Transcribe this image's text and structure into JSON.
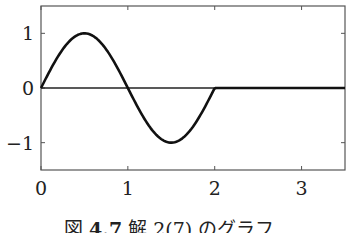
{
  "chart_data": {
    "type": "line",
    "title": "",
    "xlabel": "",
    "ylabel": "",
    "xlim": [
      0,
      3.5
    ],
    "ylim": [
      -1.5,
      1.5
    ],
    "grid": false,
    "legend": null,
    "x_ticks": [
      0,
      1,
      2,
      3
    ],
    "y_ticks": [
      -1,
      0,
      1
    ],
    "x_tick_labels": [
      "0",
      "1",
      "2",
      "3"
    ],
    "y_tick_labels": [
      "−1",
      "0",
      "1"
    ],
    "horizontal_reference_line": 0,
    "series": [
      {
        "name": "y = sin(πx) for 0≤x≤2, 0 otherwise",
        "x": [
          0,
          0.25,
          0.5,
          0.75,
          1,
          1.25,
          1.5,
          1.75,
          2,
          2.5,
          3,
          3.5
        ],
        "values": [
          0,
          0.71,
          1,
          0.71,
          0,
          -0.71,
          -1,
          -0.71,
          0,
          0,
          0,
          0
        ]
      }
    ]
  },
  "caption": {
    "figure_label": "図",
    "figure_number": "4.7",
    "text": "解 2(7) のグラフ"
  }
}
